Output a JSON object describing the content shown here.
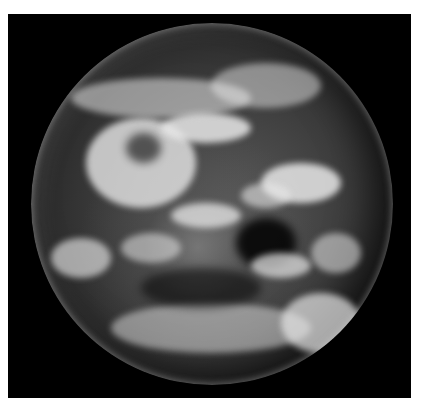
{
  "image": {
    "subject": "Earth viewed from space",
    "style": "grayscale satellite photograph",
    "background": "#000000",
    "border": "#ffffff"
  }
}
